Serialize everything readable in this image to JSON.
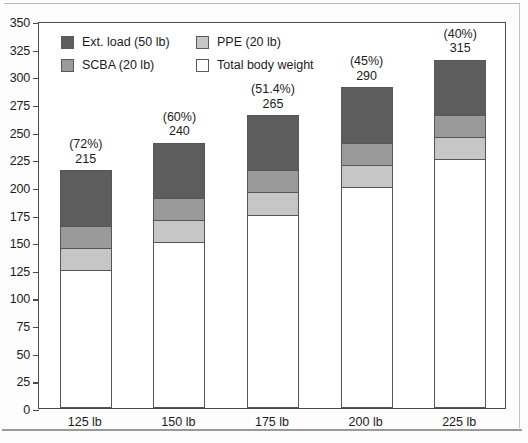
{
  "chart_data": {
    "type": "bar",
    "subtype": "stacked-bar",
    "title": "",
    "xlabel": "",
    "ylabel": "",
    "categories": [
      "125 lb",
      "150 lb",
      "175 lb",
      "200 lb",
      "225 lb"
    ],
    "ylim": [
      0,
      350
    ],
    "ytick_step": 25,
    "ytick_labels": [
      "350",
      "325",
      "300",
      "275",
      "250",
      "225",
      "200",
      "175",
      "150",
      "125",
      "100",
      "75",
      "50",
      "25",
      "0"
    ],
    "ytick_values": [
      350,
      325,
      300,
      275,
      250,
      225,
      200,
      175,
      150,
      125,
      100,
      75,
      50,
      25,
      0
    ],
    "grid": false,
    "legend_position": "top-left-inside",
    "stack_order_bottom_to_top": [
      "Total body weight",
      "PPE (20 lb)",
      "SCBA (20 lb)",
      "Ext. load (50 lb)"
    ],
    "series": [
      {
        "name": "Total body weight",
        "color": "#ffffff",
        "values": [
          125,
          150,
          175,
          200,
          225
        ]
      },
      {
        "name": "PPE (20 lb)",
        "color": "#c6c6c6",
        "values": [
          20,
          20,
          20,
          20,
          20
        ]
      },
      {
        "name": "SCBA (20 lb)",
        "color": "#9a9a9a",
        "values": [
          20,
          20,
          20,
          20,
          20
        ]
      },
      {
        "name": "Ext. load (50 lb)",
        "color": "#5d5d5d",
        "values": [
          50,
          50,
          50,
          50,
          50
        ]
      }
    ],
    "totals": [
      215,
      240,
      265,
      290,
      315
    ],
    "annotations": [
      {
        "percent": "(72%)",
        "total": "215"
      },
      {
        "percent": "(60%)",
        "total": "240"
      },
      {
        "percent": "(51.4%)",
        "total": "265"
      },
      {
        "percent": "(45%)",
        "total": "290"
      },
      {
        "percent": "(40%)",
        "total": "315"
      }
    ]
  },
  "legend": {
    "items": [
      {
        "label": "Ext. load (50 lb)",
        "color": "#5d5d5d"
      },
      {
        "label": "PPE (20 lb)",
        "color": "#c6c6c6"
      },
      {
        "label": "SCBA (20 lb)",
        "color": "#9a9a9a"
      },
      {
        "label": "Total body weight",
        "color": "#ffffff"
      }
    ]
  },
  "colors": {
    "ext_load": "#5d5d5d",
    "scba": "#9a9a9a",
    "ppe": "#c6c6c6",
    "body_weight": "#ffffff",
    "axis": "#4a4a4a",
    "text": "#1c1c1c"
  }
}
